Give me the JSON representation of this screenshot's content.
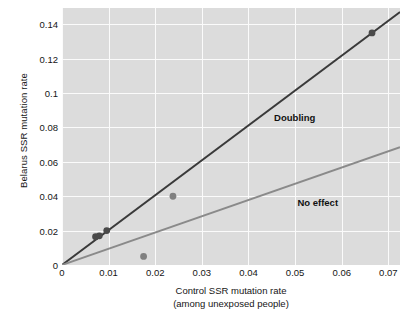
{
  "chart_data": {
    "type": "scatter",
    "title": "",
    "xlabel": "Control SSR mutation rate",
    "xlabel_sub": "(among unexposed people)",
    "ylabel": "Belarus SSR mutation rate",
    "xlim": [
      0,
      0.0725
    ],
    "ylim": [
      0,
      0.1495
    ],
    "xticks": [
      0,
      0.01,
      0.02,
      0.03,
      0.04,
      0.05,
      0.06,
      0.07
    ],
    "xtick_labels": [
      "0",
      "0.01",
      "0.02",
      "0.03",
      "0.04",
      "0.05",
      "0.06",
      "0.07"
    ],
    "yticks": [
      0,
      0.02,
      0.04,
      0.06,
      0.08,
      0.1,
      0.12,
      0.14
    ],
    "ytick_labels": [
      "0",
      "0.02",
      "0.04",
      "0.06",
      "0.08",
      "0.1",
      "0.12",
      "0.14"
    ],
    "grid": true,
    "grid_color": "#fbfbfb",
    "panel_color": "#dcdcdc",
    "legend": "none",
    "points": [
      {
        "x": 0.0072,
        "y": 0.0165,
        "color": "#4a4a4a",
        "r": 3.4
      },
      {
        "x": 0.008,
        "y": 0.017,
        "color": "#4a4a4a",
        "r": 3.4
      },
      {
        "x": 0.0096,
        "y": 0.02,
        "color": "#4a4a4a",
        "r": 3.4
      },
      {
        "x": 0.0175,
        "y": 0.005,
        "color": "#808080",
        "r": 3.4
      },
      {
        "x": 0.0238,
        "y": 0.04,
        "color": "#808080",
        "r": 3.4
      },
      {
        "x": 0.0665,
        "y": 0.135,
        "color": "#4a4a4a",
        "r": 3.4
      }
    ],
    "lines": [
      {
        "name": "Doubling",
        "label": "Doubling",
        "color": "#3a3a3a",
        "width": 1.9,
        "slope": 2.03,
        "intercept": 0,
        "x_start": 0,
        "x_end": 0.0725,
        "label_x": 0.0455,
        "label_y": 0.0855
      },
      {
        "name": "No effect",
        "label": "No effect",
        "color": "#8a8a8a",
        "width": 1.9,
        "slope": 0.945,
        "intercept": 0,
        "x_start": 0,
        "x_end": 0.0725,
        "label_x": 0.0505,
        "label_y": 0.036
      }
    ]
  }
}
